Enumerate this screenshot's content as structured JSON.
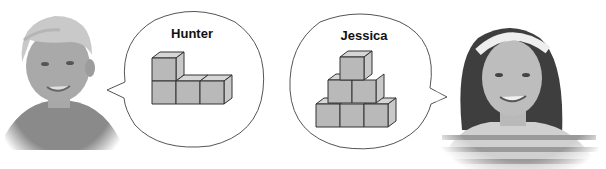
{
  "figure": {
    "characters": [
      {
        "name": "Hunter",
        "description": "boy with short light hair smiling",
        "structure": {
          "shape": "L-shaped",
          "cube_count": 4,
          "rows": [
            {
              "level": "top",
              "cubes": 1,
              "position": "left"
            },
            {
              "level": "bottom",
              "cubes": 3
            }
          ]
        }
      },
      {
        "name": "Jessica",
        "description": "girl with long dark hair and headband, striped shirt, smiling",
        "structure": {
          "shape": "pyramid",
          "cube_count": 6,
          "rows": [
            {
              "level": "top",
              "cubes": 1
            },
            {
              "level": "middle",
              "cubes": 2
            },
            {
              "level": "bottom",
              "cubes": 3
            }
          ]
        }
      }
    ]
  },
  "colors": {
    "cube_front": "#b9b9b9",
    "cube_top": "#d6d6d6",
    "cube_side": "#c9c9c9",
    "outline": "#333333",
    "bubble_fill": "#ffffff",
    "bubble_stroke": "#555555"
  }
}
